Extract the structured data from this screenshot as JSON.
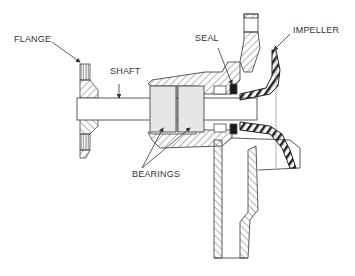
{
  "diagram": {
    "labels": {
      "flange": "FLANGE",
      "shaft": "SHAFT",
      "seal": "SEAL",
      "impeller": "IMPELLER",
      "bearings": "BEARINGS"
    },
    "colors": {
      "line": "#4a4a4a",
      "hatch": "#666666",
      "bearing_fill": "#e6e6e6",
      "seal_fill": "#1a1a1a",
      "background": "#ffffff"
    }
  }
}
